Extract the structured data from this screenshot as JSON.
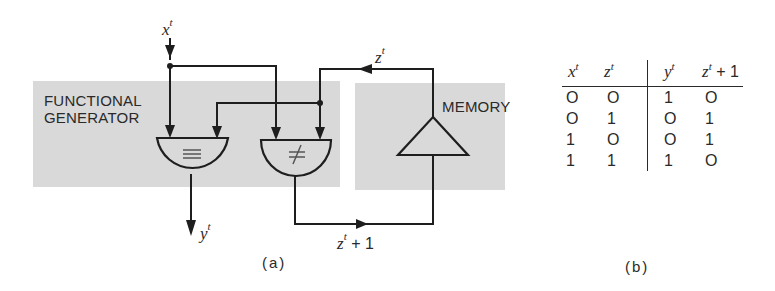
{
  "figure": {
    "panel_a": {
      "caption": "(a)",
      "blocks": {
        "functional_generator": {
          "label_line1": "FUNCTIONAL",
          "label_line2": "GENERATOR"
        },
        "memory": {
          "label": "MEMORY"
        }
      },
      "gates": [
        {
          "id": "equivalence",
          "symbol": "≡",
          "output": "y"
        },
        {
          "id": "non-equivalence",
          "symbol": "≠",
          "output": "z+1"
        }
      ],
      "signals": {
        "input_x": {
          "base": "x",
          "sup": "t"
        },
        "state_z": {
          "base": "z",
          "sup": "t"
        },
        "output_y": {
          "base": "y",
          "sup": "t"
        },
        "next_z": {
          "base": "z",
          "sup": "t",
          "suffix": " + 1"
        }
      }
    },
    "panel_b": {
      "caption": "(b)",
      "truth_table": {
        "inputs": [
          {
            "base": "x",
            "sup": "t"
          },
          {
            "base": "z",
            "sup": "t"
          }
        ],
        "outputs": [
          {
            "base": "y",
            "sup": "t"
          },
          {
            "base": "z",
            "sup": "t",
            "suffix": " + 1"
          }
        ],
        "rows": [
          [
            "O",
            "O",
            "1",
            "O"
          ],
          [
            "O",
            "1",
            "O",
            "1"
          ],
          [
            "1",
            "O",
            "O",
            "1"
          ],
          [
            "1",
            "1",
            "1",
            "O"
          ]
        ]
      }
    },
    "colors": {
      "panel_fill": "#d9d9d9",
      "line": "#1e1e1e",
      "background": "#ffffff"
    }
  }
}
